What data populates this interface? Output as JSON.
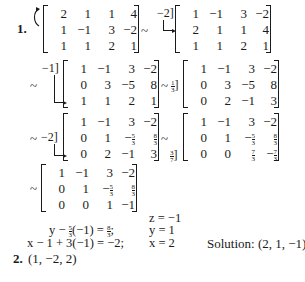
{
  "problems": [
    {
      "number": "1.",
      "steps": [
        {
          "id": "m1",
          "rows": [
            [
              "2",
              "1",
              "1",
              "4"
            ],
            [
              "1",
              "−1",
              "3",
              "−2"
            ],
            [
              "1",
              "1",
              "2",
              "1"
            ]
          ]
        },
        {
          "id": "m2",
          "rows": [
            [
              "1",
              "−1",
              "3",
              "−2"
            ],
            [
              "2",
              "1",
              "1",
              "4"
            ],
            [
              "1",
              "1",
              "2",
              "1"
            ]
          ],
          "op": "−2]"
        },
        {
          "id": "m3",
          "rows": [
            [
              "1",
              "−1",
              "3",
              "−2"
            ],
            [
              "0",
              "3",
              "−5",
              "8"
            ],
            [
              "1",
              "1",
              "2",
              "1"
            ]
          ],
          "op": "−1]"
        },
        {
          "id": "m4",
          "rows": [
            [
              "1",
              "−1",
              "3",
              "−2"
            ],
            [
              "0",
              "3",
              "−5",
              "8"
            ],
            [
              "0",
              "2",
              "−1",
              "3"
            ]
          ],
          "op_num": "1",
          "op_den": "3",
          "op_suffix": "]"
        },
        {
          "id": "m5",
          "rows": [
            [
              "1",
              "−1",
              "3",
              "−2"
            ],
            [
              "0",
              "1",
              "−5/3",
              "8/3"
            ],
            [
              "0",
              "2",
              "−1",
              "3"
            ]
          ],
          "op": "−2]"
        },
        {
          "id": "m6",
          "rows": [
            [
              "1",
              "−1",
              "3",
              "−2"
            ],
            [
              "0",
              "1",
              "−5/3",
              "8/3"
            ],
            [
              "0",
              "0",
              "7/3",
              "−7/3"
            ]
          ],
          "op_num": "3",
          "op_den": "7",
          "op_suffix": "]"
        },
        {
          "id": "m7",
          "rows": [
            [
              "1",
              "−1",
              "3",
              "−2"
            ],
            [
              "0",
              "1",
              "−5/3",
              "8/3"
            ],
            [
              "0",
              "0",
              "1",
              "−1"
            ]
          ]
        }
      ],
      "tilde": "~",
      "back_substitution": {
        "z_line": "z = −1",
        "y_left_pre": "y − ",
        "y_left_frac": {
          "num": "5",
          "den": "3"
        },
        "y_left_mid": "(−1) = ",
        "y_right_frac": {
          "num": "8",
          "den": "3"
        },
        "y_left_post": ";",
        "y_result": "y = 1",
        "x_left": "x − 1 + 3(−1) = −2;",
        "x_result": "x = 2",
        "solution": "Solution: (2, 1, −1)"
      }
    },
    {
      "number": "2.",
      "answer": "(1, −2, 2)"
    }
  ]
}
